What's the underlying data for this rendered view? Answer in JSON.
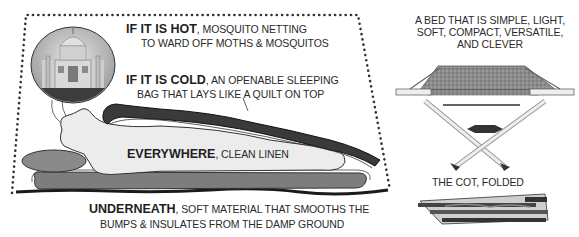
{
  "diagram": {
    "main_panel": {
      "hot": {
        "lead": "IF IT IS HOT",
        "sep": ", ",
        "line1": "MOSQUITO NETTING",
        "line2": "TO WARD OFF MOTHS & MOSQUITOS"
      },
      "cold": {
        "lead": "IF IT IS COLD",
        "sep": ", ",
        "line1": "AN OPENABLE SLEEPING",
        "line2": "BAG THAT LAYS LIKE A QUILT ON TOP"
      },
      "everywhere": {
        "lead": "EVERYWHERE",
        "sep": ", ",
        "line1": "CLEAN LINEN"
      },
      "underneath": {
        "lead": "UNDERNEATH",
        "sep": ", ",
        "line1": "SOFT MATERIAL THAT SMOOTHS THE",
        "line2": "BUMPS & INSULATES FROM THE DAMP GROUND"
      },
      "illustration": "taj-mahal-dream-bubble-sleeper"
    },
    "side_panel": {
      "caption_lines": [
        "A BED THAT IS SIMPLE, LIGHT,",
        "SOFT, COMPACT, VERSATILE,",
        "AND CLEVER"
      ],
      "folded_caption": "THE COT, FOLDED",
      "illustrations": [
        "open-camp-cot",
        "folded-camp-cot"
      ]
    },
    "colors": {
      "ink": "#222222",
      "bag": "#3a3a3a",
      "pillow": "#8a8a8a",
      "mat": "#7d7d7d",
      "linen": "#ececec",
      "dots": "#333333"
    }
  }
}
